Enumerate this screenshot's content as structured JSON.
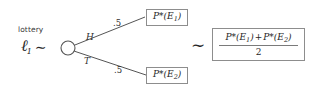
{
  "figure": {
    "type": "decision-tree-diagram",
    "background_color": "#ffffff",
    "ink_color": "#2a2a2a",
    "box_border_color": "#8d8d8d"
  },
  "lottery": {
    "caption": "lottery",
    "symbol": "ℓ",
    "subscript": "1",
    "relation": "∼"
  },
  "node": {
    "shape": "circle",
    "cx": 68,
    "cy": 48,
    "r": 7
  },
  "branches": [
    {
      "id": "heads",
      "letter": "H",
      "probability": ".5",
      "from": {
        "x": 75,
        "y": 45
      },
      "to": {
        "x": 145,
        "y": 17
      }
    },
    {
      "id": "tails",
      "letter": "T",
      "probability": ".5",
      "from": {
        "x": 75,
        "y": 52
      },
      "to": {
        "x": 146,
        "y": 75
      }
    }
  ],
  "outcomes": [
    {
      "id": "outcome-e1",
      "prefix": "P",
      "star": "*",
      "open": "(",
      "event": "E",
      "event_index": "1",
      "close": ")"
    },
    {
      "id": "outcome-e2",
      "prefix": "P",
      "star": "*",
      "open": "(",
      "event": "E",
      "event_index": "2",
      "close": ")"
    }
  ],
  "equivalence": {
    "symbol": "∼"
  },
  "expected_value": {
    "numerator": {
      "term1_prefix": "P",
      "term1_star": "*",
      "term1_open": "(",
      "term1_event": "E",
      "term1_index": "1",
      "term1_close": ")",
      "operator": "+",
      "term2_prefix": "P",
      "term2_star": "*",
      "term2_open": "(",
      "term2_event": "E",
      "term2_index": "2",
      "term2_close": ")"
    },
    "denominator": "2"
  }
}
